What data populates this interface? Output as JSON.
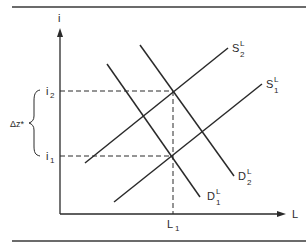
{
  "diagram": {
    "type": "supply-demand",
    "colors": {
      "ink": "#2a2a2a",
      "background": "#ffffff",
      "rule": "#3a3a3a"
    },
    "axes": {
      "y_label": "i",
      "x_label": "L"
    },
    "y_ticks": [
      {
        "base": "i",
        "sub": "2"
      },
      {
        "base": "i",
        "sub": "1"
      }
    ],
    "x_ticks": [
      {
        "base": "L",
        "sub": "1"
      }
    ],
    "brace_label": "Δz*",
    "curves": [
      {
        "name": "S",
        "sup": "L",
        "sub": "2"
      },
      {
        "name": "S",
        "sup": "L",
        "sub": "1"
      },
      {
        "name": "D",
        "sup": "L",
        "sub": "2"
      },
      {
        "name": "D",
        "sup": "L",
        "sub": "1"
      }
    ]
  }
}
